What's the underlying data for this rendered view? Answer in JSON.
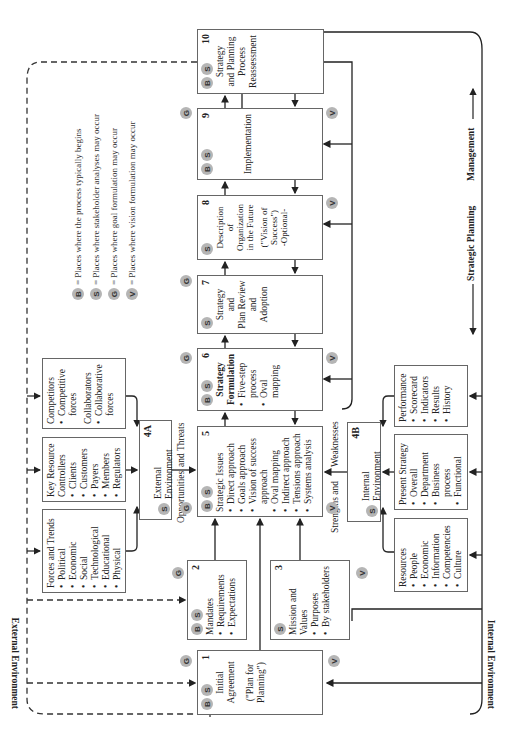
{
  "legend": [
    {
      "badge": "B",
      "text": "= Places where the process typically begins"
    },
    {
      "badge": "S",
      "text": "= Places where stakeholder analyses may occur"
    },
    {
      "badge": "G",
      "text": "= Places where goal formulation may occur"
    },
    {
      "badge": "V",
      "text": "= Places where vision formulation may occur"
    }
  ],
  "steps": {
    "s1": {
      "num": "1",
      "badges": [
        "B",
        "S"
      ],
      "lines": [
        "Initial",
        "Agreement",
        "",
        "(\"Plan for",
        "Planning\")"
      ]
    },
    "s2": {
      "num": "2",
      "badges": [
        "B",
        "S"
      ],
      "title": "Mandates",
      "items": [
        "Requirements",
        "Expectations"
      ]
    },
    "s3": {
      "num": "3",
      "badges": [
        "S"
      ],
      "title": "Mission and Values",
      "items": [
        "Purposes",
        "By stakeholders"
      ]
    },
    "s4a": {
      "num": "4A",
      "badges": [
        "S"
      ],
      "title": "External Environment"
    },
    "s4b": {
      "num": "4B",
      "badges": [
        "S"
      ],
      "title": "Internal Environment"
    },
    "s5": {
      "num": "5",
      "badges": [
        "B",
        "S"
      ],
      "title": "Strategic Issues",
      "items": [
        "Direct approach",
        "Goals approach",
        "Vision of success approach",
        "Oval mapping",
        "Indirect approach",
        "Tensions approach",
        "Systems analysis"
      ]
    },
    "s6": {
      "num": "6",
      "badges": [
        "B",
        "S"
      ],
      "title": "Strategy Formulation",
      "items": [
        "Five-step process",
        "Oval mapping"
      ]
    },
    "s7": {
      "num": "7",
      "badges": [
        "S"
      ],
      "lines": [
        "Strategy",
        "and",
        "Plan Review",
        "and",
        "Adoption"
      ]
    },
    "s8": {
      "num": "8",
      "badges": [
        "S"
      ],
      "lines": [
        "Description",
        "of",
        "Organization",
        "in the Future",
        "",
        "(\"Vision of",
        "Success\")",
        "-Optional-"
      ]
    },
    "s9": {
      "num": "9",
      "badges": [
        "B",
        "S"
      ],
      "lines": [
        "Implementation"
      ]
    },
    "s10": {
      "num": "10",
      "badges": [
        "B",
        "S"
      ],
      "lines": [
        "Strategy",
        "and Planning",
        "Process",
        "Reassessment"
      ]
    }
  },
  "external": {
    "forces": {
      "title": "Forces and Trends",
      "items": [
        "Political",
        "Economic",
        "Social",
        "Technological",
        "Educational",
        "Physical"
      ]
    },
    "key_resource": {
      "title": "Key Resource Controllers",
      "items": [
        "Clients",
        "Customers",
        "Payers",
        "Members",
        "Regulators"
      ]
    },
    "competitors": {
      "title": "Competitors",
      "items": [
        "Competitive forces"
      ],
      "title2": "Collaborators",
      "items2": [
        "Collaborative forces"
      ]
    }
  },
  "internal": {
    "resources": {
      "title": "Resources",
      "items": [
        "People",
        "Economic",
        "Information",
        "Competencies",
        "Culture"
      ]
    },
    "present_strategy": {
      "title": "Present Strategy",
      "items": [
        "Overall",
        "Department",
        "Business process",
        "Functional"
      ]
    },
    "performance": {
      "title": "Performance",
      "items": [
        "Scorecard",
        "Indicators",
        "Results",
        "History"
      ]
    }
  },
  "labels": {
    "opportunities": "Opportunities",
    "and_threats": "and Threats",
    "strengths": "Strengths and",
    "weaknesses": "Weaknesses",
    "external_environment": "External Environment",
    "internal_environment": "Internal Environment",
    "strategic_planning": "Strategic Planning",
    "management": "Management"
  },
  "outer_badges": {
    "g1": "G",
    "v1": "V",
    "g2": "G",
    "v3": "V",
    "g5": "G",
    "v5": "V",
    "g6": "G",
    "v6": "V",
    "g7": "G",
    "v8": "V",
    "g9": "G",
    "v9": "V"
  }
}
